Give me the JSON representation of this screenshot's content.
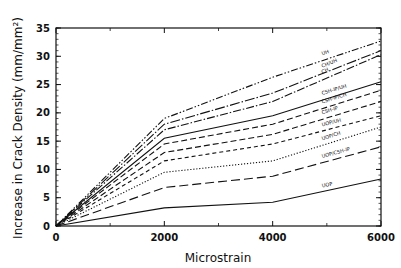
{
  "chart_data": {
    "type": "line",
    "title": "",
    "xlabel": "Microstrain",
    "ylabel": "Increase in Crack Density (mm/mm²)",
    "xlim": [
      0,
      6000
    ],
    "ylim": [
      0,
      35
    ],
    "x_ticks": [
      0,
      2000,
      4000,
      6000
    ],
    "y_ticks": [
      0,
      5,
      10,
      15,
      20,
      25,
      30,
      35
    ],
    "grid": false,
    "legend_position": "inline labels near right end of each line",
    "x": [
      0,
      2000,
      4000,
      6000
    ],
    "series": [
      {
        "name": "UH",
        "style": "dash-dot-dot",
        "values": [
          0,
          19.0,
          26.3,
          32.7
        ]
      },
      {
        "name": "CH/UH",
        "style": "long-dash-dot",
        "values": [
          0,
          18.0,
          23.5,
          31.0
        ]
      },
      {
        "name": "CH",
        "style": "dash-dot",
        "values": [
          0,
          17.0,
          22.0,
          30.3
        ]
      },
      {
        "name": "CSH-IP/UH",
        "style": "solid",
        "values": [
          0,
          15.5,
          19.5,
          25.5
        ]
      },
      {
        "name": "CSH-IP/CH",
        "style": "dashed",
        "values": [
          0,
          14.5,
          18.0,
          24.0
        ]
      },
      {
        "name": "CSH-IP",
        "style": "dashed",
        "values": [
          0,
          13.0,
          16.2,
          22.0
        ]
      },
      {
        "name": "UOP/UH",
        "style": "short-dash",
        "values": [
          0,
          11.5,
          14.5,
          19.5
        ]
      },
      {
        "name": "UOP/CH",
        "style": "dotted",
        "values": [
          0,
          9.5,
          11.5,
          17.5
        ]
      },
      {
        "name": "UOP/CSH-IP",
        "style": "long-dash",
        "values": [
          0,
          6.8,
          8.8,
          14.0
        ]
      },
      {
        "name": "UOP",
        "style": "solid",
        "values": [
          0,
          3.2,
          4.2,
          8.3
        ]
      }
    ]
  },
  "labels": {
    "xlabel": "Microstrain",
    "ylabel": "Increase in Crack Density (mm/mm²)",
    "x_ticks": [
      "0",
      "2000",
      "4000",
      "6000"
    ],
    "y_ticks": [
      "0",
      "5",
      "10",
      "15",
      "20",
      "25",
      "30",
      "35"
    ],
    "series": [
      "UH",
      "CH/UH",
      "CH",
      "CSH-IP/UH",
      "CSH-IP/CH",
      "CSH-IP",
      "UOP/UH",
      "UOP/CH",
      "UOP/CSH-IP",
      "UOP"
    ]
  }
}
